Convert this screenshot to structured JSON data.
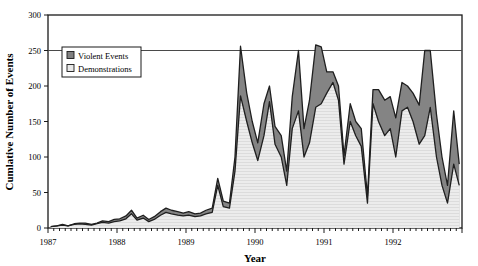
{
  "chart_data": {
    "type": "area",
    "stacked": true,
    "title": "",
    "xlabel": "Year",
    "ylabel": "Cumlative Number of Events",
    "ylim": [
      0,
      300
    ],
    "yticks": [
      0,
      50,
      100,
      150,
      200,
      250,
      300
    ],
    "ytick_labels": [
      "0",
      "50",
      "100",
      "150",
      "200",
      "250",
      "300"
    ],
    "xlim": [
      1987.0,
      1993.0
    ],
    "xticks": [
      1987,
      1988,
      1989,
      1990,
      1991,
      1992
    ],
    "xtick_labels": [
      "1987",
      "1988",
      "1989",
      "1990",
      "1991",
      "1992"
    ],
    "minor_xticks_per_major": 12,
    "grid": "single-horizontal-line-at-250",
    "legend": {
      "position": "upper-left-inside",
      "entries": [
        {
          "label": "Violent Events",
          "color": "#808080",
          "marker": "filled-square"
        },
        {
          "label": "Demonstrations",
          "color": "#e8e8e8",
          "marker": "open-square"
        }
      ]
    },
    "x": [
      1987.04,
      1987.13,
      1987.21,
      1987.29,
      1987.38,
      1987.46,
      1987.54,
      1987.63,
      1987.71,
      1987.79,
      1987.88,
      1987.96,
      1988.04,
      1988.13,
      1988.21,
      1988.29,
      1988.38,
      1988.46,
      1988.54,
      1988.63,
      1988.71,
      1988.79,
      1988.88,
      1988.96,
      1989.04,
      1989.13,
      1989.21,
      1989.29,
      1989.38,
      1989.46,
      1989.54,
      1989.63,
      1989.71,
      1989.79,
      1989.88,
      1989.96,
      1990.04,
      1990.13,
      1990.21,
      1990.29,
      1990.38,
      1990.46,
      1990.54,
      1990.63,
      1990.71,
      1990.79,
      1990.88,
      1990.96,
      1991.04,
      1991.13,
      1991.21,
      1991.29,
      1991.38,
      1991.46,
      1991.54,
      1991.63,
      1991.71,
      1991.79,
      1991.88,
      1991.96,
      1992.04,
      1992.13,
      1992.21,
      1992.29,
      1992.38,
      1992.46,
      1992.54,
      1992.63,
      1992.71,
      1992.79,
      1992.88,
      1992.96
    ],
    "series": [
      {
        "name": "Demonstrations",
        "color": "#e9e9e9",
        "values": [
          2,
          3,
          4,
          3,
          5,
          6,
          5,
          4,
          6,
          8,
          7,
          9,
          10,
          13,
          20,
          11,
          14,
          9,
          12,
          18,
          22,
          20,
          18,
          17,
          18,
          16,
          17,
          20,
          22,
          60,
          30,
          28,
          80,
          186,
          150,
          120,
          95,
          130,
          178,
          118,
          100,
          60,
          140,
          165,
          100,
          120,
          170,
          175,
          190,
          205,
          180,
          90,
          150,
          130,
          115,
          35,
          175,
          150,
          130,
          140,
          100,
          165,
          170,
          150,
          118,
          130,
          170,
          100,
          60,
          35,
          90,
          60
        ]
      },
      {
        "name": "Violent Events",
        "color": "#848484",
        "values": [
          0,
          0,
          1,
          0,
          1,
          1,
          2,
          1,
          1,
          2,
          2,
          3,
          3,
          4,
          5,
          3,
          4,
          3,
          4,
          5,
          6,
          5,
          5,
          4,
          5,
          4,
          4,
          5,
          6,
          10,
          8,
          7,
          20,
          70,
          40,
          30,
          25,
          45,
          22,
          25,
          30,
          20,
          45,
          85,
          40,
          60,
          88,
          80,
          30,
          15,
          20,
          12,
          25,
          20,
          25,
          10,
          20,
          45,
          50,
          45,
          55,
          40,
          30,
          40,
          55,
          120,
          80,
          60,
          40,
          25,
          75,
          30
        ]
      }
    ],
    "peaks_at_250": [
      1989.79,
      1990.88,
      1992.46
    ]
  }
}
